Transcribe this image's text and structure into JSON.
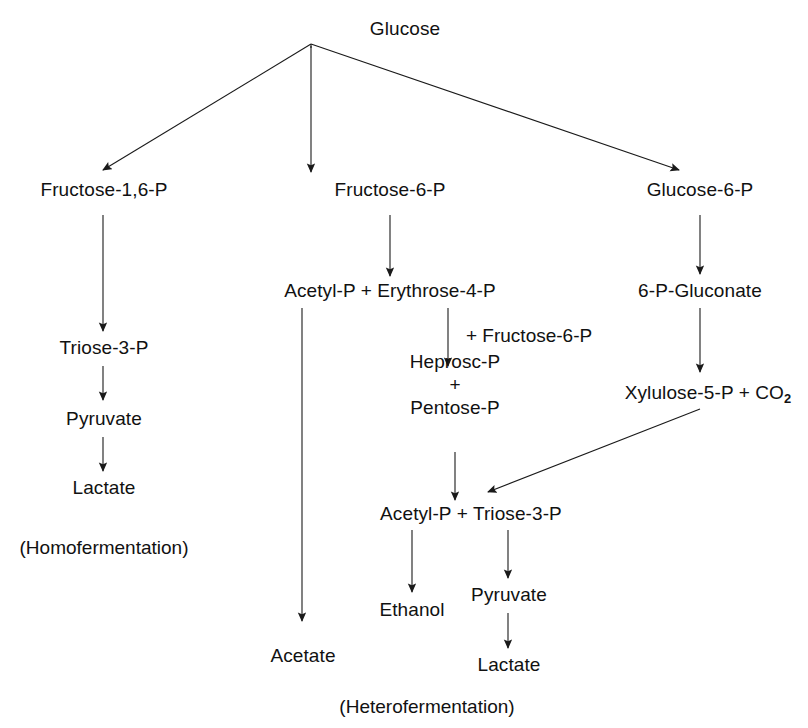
{
  "diagram": {
    "background_color": "#ffffff",
    "line_color": "#1a1a1a",
    "text_color": "#111111",
    "nodes": {
      "glucose": "Glucose",
      "fructose_1_6_p": "Fructose-1,6-P",
      "fructose_6_p": "Fructose-6-P",
      "glucose_6_p": "Glucose-6-P",
      "acetyl_p_erythrose": "Acetyl-P + Erythrose-4-P",
      "gluconate": "6-P-Gluconate",
      "triose_3_p": "Triose-3-P",
      "pyruvate_left": "Pyruvate",
      "lactate_left": "Lactate",
      "heprosc_p": "Heprosc-P",
      "plus_sign": "+",
      "pentose_p": "Pentose-P",
      "xylulose_5_p_line": "Xylulose-5-P + CO",
      "xylulose_5_p_sub": "2",
      "acetyl_p_triose": "Acetyl-P + Triose-3-P",
      "ethanol": "Ethanol",
      "pyruvate_right": "Pyruvate",
      "lactate_right": "Lactate",
      "acetate": "Acetate"
    },
    "annotations": {
      "plus_fructose_6_p": "+ Fructose-6-P"
    },
    "captions": {
      "homofermentation": "(Homofermentation)",
      "heterofermentation": "(Heterofermentation)"
    },
    "edges": [
      {
        "name": "glucose-to-fructose-1-6-p",
        "from": "glucose",
        "to": "fructose_1_6_p",
        "style": "diagonal"
      },
      {
        "name": "glucose-to-fructose-6-p",
        "from": "glucose",
        "to": "fructose_6_p",
        "style": "vertical"
      },
      {
        "name": "glucose-to-glucose-6-p",
        "from": "glucose",
        "to": "glucose_6_p",
        "style": "diagonal"
      },
      {
        "name": "fructose-1-6-p-to-triose-3-p",
        "from": "fructose_1_6_p",
        "to": "triose_3_p",
        "style": "vertical"
      },
      {
        "name": "triose-3-p-to-pyruvate",
        "from": "triose_3_p",
        "to": "pyruvate_left",
        "style": "vertical"
      },
      {
        "name": "pyruvate-to-lactate",
        "from": "pyruvate_left",
        "to": "lactate_left",
        "style": "vertical"
      },
      {
        "name": "fructose-6-p-to-acetyl-p-erythrose",
        "from": "fructose_6_p",
        "to": "acetyl_p_erythrose",
        "style": "vertical"
      },
      {
        "name": "acetyl-p-to-acetate",
        "from": "acetyl_p_erythrose",
        "to": "acetate",
        "style": "vertical"
      },
      {
        "name": "erythrose-to-heprosc-p",
        "from": "acetyl_p_erythrose",
        "to": "heprosc_p",
        "style": "vertical"
      },
      {
        "name": "pentose-p-to-acetyl-p-triose",
        "from": "pentose_p",
        "to": "acetyl_p_triose",
        "style": "vertical"
      },
      {
        "name": "glucose-6-p-to-gluconate",
        "from": "glucose_6_p",
        "to": "gluconate",
        "style": "vertical"
      },
      {
        "name": "gluconate-to-xylulose-5-p",
        "from": "gluconate",
        "to": "xylulose_5_p",
        "style": "vertical"
      },
      {
        "name": "xylulose-5-p-to-acetyl-p-triose",
        "from": "xylulose_5_p",
        "to": "acetyl_p_triose",
        "style": "diagonal"
      },
      {
        "name": "acetyl-p-to-ethanol",
        "from": "acetyl_p_triose",
        "to": "ethanol",
        "style": "vertical"
      },
      {
        "name": "triose-3-p-to-pyruvate-right",
        "from": "acetyl_p_triose",
        "to": "pyruvate_right",
        "style": "vertical"
      },
      {
        "name": "pyruvate-right-to-lactate-right",
        "from": "pyruvate_right",
        "to": "lactate_right",
        "style": "vertical"
      }
    ]
  }
}
